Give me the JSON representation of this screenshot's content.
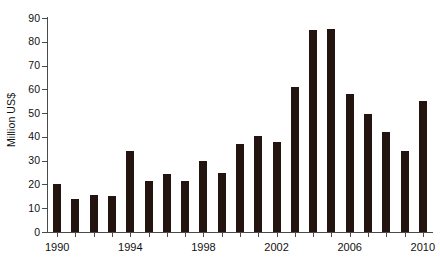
{
  "chart_data": {
    "type": "bar",
    "title": "",
    "xlabel": "",
    "ylabel": "Million US$",
    "ylim": [
      0,
      90
    ],
    "ytick_values": [
      0,
      10,
      20,
      30,
      40,
      50,
      60,
      70,
      80,
      90
    ],
    "ytick_labels": [
      "0",
      "10",
      "20",
      "30",
      "40",
      "50",
      "60",
      "70",
      "80",
      "90"
    ],
    "xlim": [
      1989.5,
      2010.5
    ],
    "xtick_values": [
      1990,
      1994,
      1998,
      2002,
      2006,
      2010
    ],
    "xtick_labels": [
      "1990",
      "1994",
      "1998",
      "2002",
      "2006",
      "2010"
    ],
    "grid": false,
    "legend": null,
    "bar_color": "#241410",
    "axis_color": "#4a4a4a",
    "background_color": "#ffffff",
    "categories": [
      "1990",
      "1991",
      "1992",
      "1993",
      "1994",
      "1995",
      "1996",
      "1997",
      "1998",
      "1999",
      "2000",
      "2001",
      "2002",
      "2003",
      "2004",
      "2005",
      "2006",
      "2007",
      "2008",
      "2009",
      "2010"
    ],
    "values": [
      20,
      14,
      15.5,
      15,
      34,
      21.5,
      24.5,
      21.5,
      30,
      25,
      37,
      40.5,
      38,
      61,
      85,
      85.5,
      58,
      49.5,
      42,
      34,
      55
    ]
  }
}
